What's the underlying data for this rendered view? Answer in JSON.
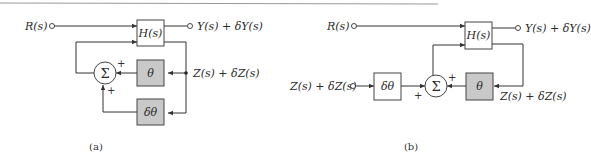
{
  "colors": {
    "stroke": "#333333",
    "shaded_block": "#c9c9c9",
    "plain_block": "#ffffff",
    "rule": "#9a9a9a"
  },
  "diagram_a": {
    "caption": "(a)",
    "input_label": "R(s)",
    "output_label": "Y(s) + δY(s)",
    "plant_block": "H(s)",
    "feedback_block": "θ",
    "perturbation_block": "δθ",
    "summer_symbol": "Σ",
    "summer_sign_top": "+",
    "summer_sign_bottom": "+",
    "signal_label": "Z(s) + δZ(s)"
  },
  "diagram_b": {
    "caption": "(b)",
    "input_label": "R(s)",
    "output_label": "Y(s) + δY(s)",
    "plant_block": "H(s)",
    "feedback_block": "θ",
    "perturbation_block": "δθ",
    "summer_symbol": "Σ",
    "summer_sign_top": "+",
    "summer_sign_left": "+",
    "perturbation_input_label": "Z(s) + δZ(s)",
    "signal_label": "Z(s) + δZ(s)"
  }
}
